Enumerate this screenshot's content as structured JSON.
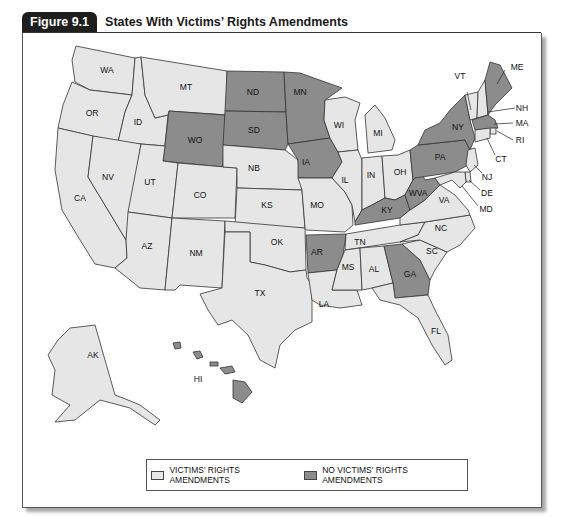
{
  "figure": {
    "number_label": "Figure 9.1",
    "title": "States With Victims’ Rights Amendments"
  },
  "colors": {
    "amendment": "#e6e6e6",
    "no_amendment": "#8c8c8c",
    "tab_background": "#1e1e1e"
  },
  "legend": {
    "items": [
      {
        "label": "VICTIMS' RIGHTS AMENDMENTS",
        "status": "amendment"
      },
      {
        "label": "NO VICTIMS' RIGHTS AMENDMENTS",
        "status": "no_amendment"
      }
    ]
  },
  "map": {
    "labels": {
      "WA": "WA",
      "OR": "OR",
      "CA": "CA",
      "ID": "ID",
      "NV": "NV",
      "MT": "MT",
      "WO": "WO",
      "UT": "UT",
      "AZ": "AZ",
      "CO": "CO",
      "NM": "NM",
      "ND": "ND",
      "SD": "SD",
      "NB": "NB",
      "KS": "KS",
      "OK": "OK",
      "TX": "TX",
      "MN": "MN",
      "IA": "IA",
      "MO": "MO",
      "AR": "AR",
      "LA": "LA",
      "WI": "WI",
      "IL": "IL",
      "MI": "MI",
      "IN": "IN",
      "OH": "OH",
      "KY": "KY",
      "TN": "TN",
      "MS": "MS",
      "AL": "AL",
      "GA": "GA",
      "FL": "FL",
      "SC": "SC",
      "NC": "NC",
      "VA": "VA",
      "WVA": "WVA",
      "PA": "PA",
      "NY": "NY",
      "VT": "VT",
      "ME": "ME",
      "NH": "NH",
      "MA": "MA",
      "RI": "RI",
      "CT": "CT",
      "NJ": "NJ",
      "DE": "DE",
      "MD": "MD",
      "AK": "AK",
      "HI": "HI"
    },
    "states_without_amendment": [
      "ND",
      "SD",
      "WO",
      "MN",
      "IA",
      "AR",
      "KY",
      "WVA",
      "GA",
      "PA",
      "NY",
      "ME",
      "MA",
      "HI"
    ],
    "states_with_amendment": [
      "WA",
      "OR",
      "CA",
      "ID",
      "NV",
      "MT",
      "UT",
      "AZ",
      "CO",
      "NM",
      "NB",
      "KS",
      "OK",
      "TX",
      "MO",
      "LA",
      "WI",
      "IL",
      "MI",
      "IN",
      "OH",
      "TN",
      "MS",
      "AL",
      "FL",
      "SC",
      "NC",
      "VA",
      "VT",
      "NH",
      "RI",
      "CT",
      "NJ",
      "DE",
      "MD",
      "AK"
    ]
  }
}
